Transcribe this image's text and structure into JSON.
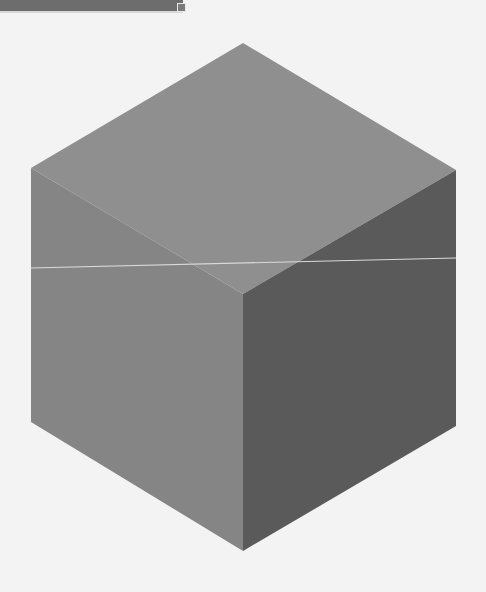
{
  "canvas": {
    "width": 486,
    "height": 592,
    "background": "#f3f3f3"
  },
  "top_bar": {
    "color": "#6d6d6d",
    "handle_border": "#e8e8e8"
  },
  "cube": {
    "top_face_color": "#8f8f8f",
    "left_face_color": "#858585",
    "right_face_color": "#5a5a5a",
    "vertices": {
      "top": [
        243,
        43
      ],
      "upper_left": [
        31,
        168
      ],
      "upper_right": [
        456,
        170
      ],
      "center": [
        243,
        294
      ],
      "lower_left": [
        31,
        422
      ],
      "lower_right": [
        456,
        426
      ],
      "bottom": [
        243,
        551
      ]
    }
  },
  "guide_line": {
    "color": "#d9d9d9",
    "from": [
      31,
      268
    ],
    "to": [
      456,
      258
    ]
  }
}
